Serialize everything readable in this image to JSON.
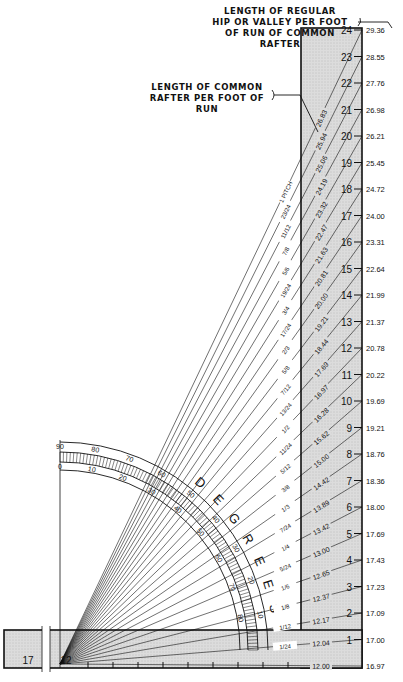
{
  "callouts": {
    "hip_valley": {
      "lines": [
        "LENGTH OF REGULAR",
        "HIP OR VALLEY PER FOOT",
        "OF RUN OF COMMON RAFTER"
      ]
    },
    "common_rafter": {
      "lines": [
        "LENGTH OF COMMON",
        "RAFTER PER FOOT OF RUN"
      ]
    }
  },
  "rise_scale": {
    "labels": [
      "24",
      "23",
      "22",
      "21",
      "20",
      "19",
      "18",
      "17",
      "16",
      "15",
      "14",
      "13",
      "12",
      "11",
      "10",
      "9",
      "8",
      "7",
      "6",
      "5",
      "4",
      "3",
      "2",
      "1"
    ]
  },
  "hip_valley_lengths": [
    "29.36",
    "28.55",
    "27.76",
    "26.98",
    "26.21",
    "25.45",
    "24.72",
    "24.00",
    "23.31",
    "22.64",
    "21.99",
    "21.37",
    "20.78",
    "20.22",
    "19.69",
    "19.21",
    "18.76",
    "18.36",
    "18.00",
    "17.69",
    "17.43",
    "17.23",
    "17.09",
    "17.00",
    "16.97"
  ],
  "common_rafter_lengths": [
    "26.83",
    "25.94",
    "25.06",
    "24.19",
    "23.32",
    "22.47",
    "21.63",
    "20.81",
    "20.00",
    "19.21",
    "18.44",
    "17.69",
    "16.97",
    "16.28",
    "15.62",
    "15.00",
    "14.42",
    "13.89",
    "13.42",
    "13.00",
    "12.65",
    "12.37",
    "12.17",
    "12.04",
    "12.00"
  ],
  "pitch_labels": [
    "1 PITCH",
    "23/24",
    "11/12",
    "7/8",
    "5/6",
    "19/24",
    "3/4",
    "17/24",
    "2/3",
    "5/8",
    "7/12",
    "13/24",
    "1/2",
    "11/24",
    "5/12",
    "3/8",
    "1/3",
    "7/24",
    "1/4",
    "5/24",
    "1/6",
    "1/8",
    "1/12",
    "1/24",
    ""
  ],
  "protractor": {
    "word": [
      "D",
      "E",
      "G",
      "R",
      "E",
      "E",
      "S"
    ],
    "outer_ticks": [
      "90",
      "80",
      "70",
      "60",
      "50",
      "40",
      "30",
      "20",
      "10"
    ],
    "inner_ticks": [
      "0",
      "10",
      "20",
      "30",
      "40",
      "50",
      "60",
      "70",
      "80"
    ]
  },
  "base_bar": {
    "labels": [
      "17",
      "12"
    ]
  },
  "colors": {
    "ink": "#111111",
    "shade": "#d9d9d9",
    "paper": "#ffffff"
  }
}
